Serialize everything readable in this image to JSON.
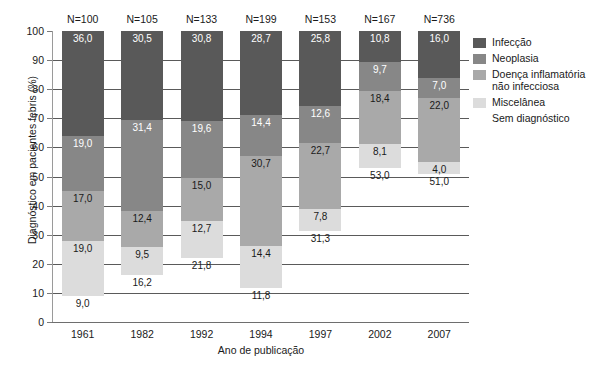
{
  "chart_data": {
    "type": "bar",
    "subtype": "stacked-percentage",
    "title": "",
    "xlabel": "Ano de publicação",
    "ylabel": "Diagnóstico em pacientes febris (%)",
    "ylim": [
      0,
      100
    ],
    "yticks": [
      0,
      10,
      20,
      30,
      40,
      50,
      60,
      70,
      80,
      90,
      100
    ],
    "ytick_labels": [
      "0",
      "10",
      "20",
      "30",
      "40",
      "50",
      "60",
      "70",
      "80",
      "90",
      "100"
    ],
    "grid": true,
    "grid_axis": "y",
    "legend_position": "right",
    "categories": [
      "1961",
      "1982",
      "1992",
      "1994",
      "1997",
      "2002",
      "2007"
    ],
    "group_counts": [
      "N=100",
      "N=105",
      "N=133",
      "N=199",
      "N=153",
      "N=167",
      "N=736"
    ],
    "series": [
      {
        "name": "Infecção",
        "color": "#595959",
        "values": [
          36.0,
          30.5,
          30.8,
          28.7,
          25.8,
          10.8,
          16.0
        ],
        "labels": [
          "36,0",
          "30,5",
          "30,8",
          "28,7",
          "25,8",
          "10,8",
          "16,0"
        ]
      },
      {
        "name": "Neoplasia",
        "color": "#878787",
        "values": [
          19.0,
          31.4,
          19.6,
          14.4,
          12.6,
          9.7,
          7.0
        ],
        "labels": [
          "19,0",
          "31,4",
          "19,6",
          "14,4",
          "12,6",
          "9,7",
          "7,0"
        ]
      },
      {
        "name": "Doença inflamatória\nnão infecciosa",
        "color": "#a9a9a9",
        "values": [
          17.0,
          12.4,
          15.0,
          30.7,
          22.7,
          18.4,
          22.0
        ],
        "labels": [
          "17,0",
          "12,4",
          "15,0",
          "30,7",
          "22,7",
          "18,4",
          "22,0"
        ]
      },
      {
        "name": "Miscelânea",
        "color": "#dcdcdc",
        "values": [
          19.0,
          9.5,
          12.7,
          14.4,
          7.8,
          8.1,
          4.0
        ],
        "labels": [
          "19,0",
          "9,5",
          "12,7",
          "14,4",
          "7,8",
          "8,1",
          "4,0"
        ]
      },
      {
        "name": "Sem diagnóstico",
        "color": "#ffffff",
        "values": [
          9.0,
          16.2,
          21.8,
          11.8,
          31.3,
          53.0,
          51.0
        ],
        "labels": [
          "9,0",
          "16,2",
          "21,8",
          "11,8",
          "31,3",
          "53,0",
          "51,0"
        ]
      }
    ]
  }
}
